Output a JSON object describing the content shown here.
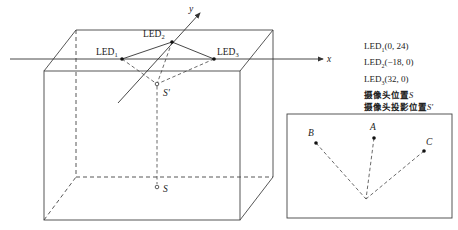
{
  "diagram": {
    "axes": {
      "x_label": "x",
      "y_label": "y"
    },
    "points": {
      "led1": {
        "label": "LED",
        "sub": "1"
      },
      "led2": {
        "label": "LED",
        "sub": "2"
      },
      "led3": {
        "label": "LED",
        "sub": "3"
      },
      "camera": {
        "label": "S"
      },
      "camera_projection": {
        "label": "S'"
      }
    },
    "legend": {
      "items": [
        {
          "prefix": "LED",
          "sub": "1",
          "coords": "(0, 24)"
        },
        {
          "prefix": "LED",
          "sub": "2",
          "coords": "(−18, 0)"
        },
        {
          "prefix": "LED",
          "sub": "3",
          "coords": "(32, 0)"
        },
        {
          "text": "摄像头位置",
          "symbol": "S"
        },
        {
          "text": "摄像头投影位置",
          "symbol": "S'"
        }
      ]
    },
    "image_plane": {
      "points": [
        {
          "label": "A"
        },
        {
          "label": "B"
        },
        {
          "label": "C"
        }
      ]
    },
    "colors": {
      "line": "#333333",
      "background": "#ffffff"
    }
  }
}
